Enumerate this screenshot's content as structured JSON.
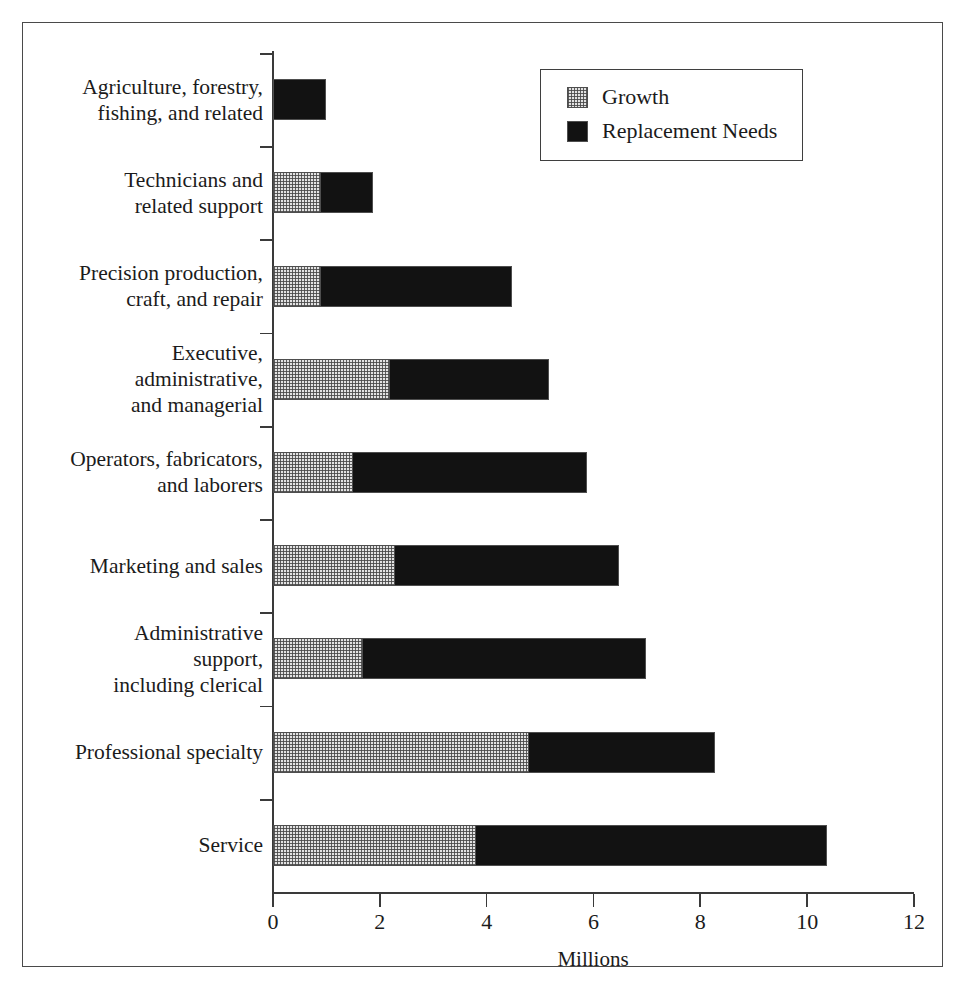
{
  "chart_data": {
    "type": "bar",
    "orientation": "horizontal",
    "stacked": true,
    "title": "",
    "xlabel": "Millions",
    "ylabel": "",
    "xlim": [
      0,
      12
    ],
    "xticks": [
      0,
      2,
      4,
      6,
      8,
      10,
      12
    ],
    "xtick_labels": [
      "0",
      "2",
      "4",
      "6",
      "8",
      "10",
      "12"
    ],
    "grid": false,
    "legend_position": "top-right",
    "categories": [
      "Agriculture, forestry,\nfishing, and related",
      "Technicians and\nrelated support",
      "Precision production,\ncraft, and repair",
      "Executive,\nadministrative,\nand managerial",
      "Operators, fabricators,\nand laborers",
      "Marketing and sales",
      "Administrative\nsupport,\nincluding clerical",
      "Professional specialty",
      "Service"
    ],
    "series": [
      {
        "name": "Growth",
        "fill": "stipple-light",
        "color": "#e2e2e2",
        "values": [
          0.0,
          0.9,
          0.9,
          2.2,
          1.5,
          2.3,
          1.7,
          4.8,
          3.8
        ]
      },
      {
        "name": "Replacement Needs",
        "fill": "solid-black",
        "color": "#121212",
        "values": [
          1.0,
          1.0,
          3.6,
          3.0,
          4.4,
          4.2,
          5.3,
          3.5,
          6.6
        ]
      }
    ],
    "totals": [
      1.0,
      1.9,
      4.5,
      5.2,
      5.9,
      6.5,
      7.0,
      8.3,
      10.4
    ]
  },
  "legend": {
    "items": [
      {
        "label": "Growth",
        "swatch": "stipple-swatch"
      },
      {
        "label": "Replacement Needs",
        "swatch": "solid-black-swatch"
      }
    ]
  },
  "axis": {
    "x_title": "Millions"
  }
}
